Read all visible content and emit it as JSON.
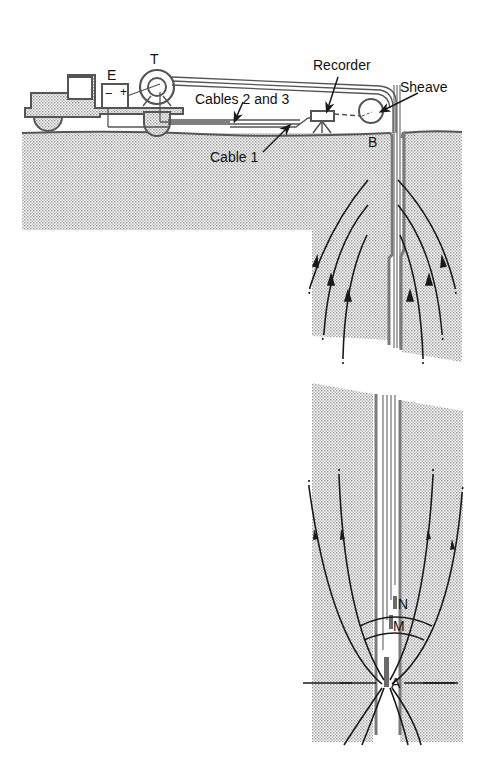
{
  "labels": {
    "E": "E",
    "T": "T",
    "battery_minus": "−",
    "battery_plus": "+",
    "recorder": "Recorder",
    "sheave": "Sheave",
    "cables_2_3": "Cables  2  and  3",
    "cable_1": "Cable  1",
    "B": "B",
    "N": "N",
    "M": "M",
    "A": "A"
  },
  "colors": {
    "ink": "#1a1a1a",
    "stipple": "#cfcfcf",
    "casing_gray": "#7a7a7a",
    "background": "#ffffff"
  }
}
